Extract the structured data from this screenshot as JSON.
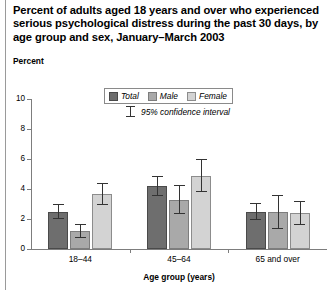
{
  "figure": {
    "title": "Percent of adults aged 18 years and over who experienced serious psychological distress during the past 30 days, by age group and sex, January–March 2003",
    "unit_label": "Percent",
    "ci_note": "95% confidence interval"
  },
  "chart_data": {
    "type": "bar",
    "title": "Percent of adults aged 18 years and over who experienced serious psychological distress during the past 30 days, by age group and sex, January–March 2003",
    "xlabel": "Age group (years)",
    "ylabel": "Percent",
    "ylim": [
      0,
      10
    ],
    "yticks": [
      0,
      2,
      4,
      6,
      8,
      10
    ],
    "grid": false,
    "legend_position": "top-center",
    "categories": [
      "18–44",
      "45–64",
      "65 and over"
    ],
    "series": [
      {
        "name": "Total",
        "color": "#6e6e6e",
        "values": [
          2.5,
          4.2,
          2.5
        ],
        "ci_low": [
          2.1,
          3.6,
          2.0
        ],
        "ci_high": [
          3.0,
          4.9,
          3.1
        ]
      },
      {
        "name": "Male",
        "color": "#a9a9a9",
        "values": [
          1.2,
          3.3,
          2.5
        ],
        "ci_low": [
          0.8,
          2.4,
          1.4
        ],
        "ci_high": [
          1.7,
          4.3,
          3.6
        ]
      },
      {
        "name": "Female",
        "color": "#d3d3d3",
        "values": [
          3.7,
          4.9,
          2.4
        ],
        "ci_low": [
          3.0,
          3.9,
          1.7
        ],
        "ci_high": [
          4.4,
          6.0,
          3.2
        ]
      }
    ]
  }
}
